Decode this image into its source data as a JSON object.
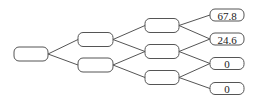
{
  "diagram": {
    "type": "binomial-tree",
    "levels": 4,
    "stroke_color": "#555555",
    "leaves": [
      {
        "label": "67.8"
      },
      {
        "label": "24.6"
      },
      {
        "label": "0"
      },
      {
        "label": "0"
      }
    ]
  }
}
